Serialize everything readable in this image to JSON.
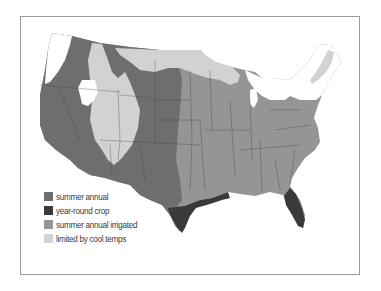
{
  "map": {
    "region": "Contiguous United States",
    "colors": {
      "summer_annual": "#6e6e6e",
      "year_round_crop": "#3a3a3a",
      "summer_annual_irrigated": "#959595",
      "limited_by_cool_temps": "#d2d2d2",
      "border": "#3f3f3f",
      "background": "#ffffff"
    }
  },
  "legend": {
    "items": [
      {
        "key": "summer_annual",
        "label": "summer annual",
        "color": "#6e6e6e"
      },
      {
        "key": "year_round_crop",
        "label": "year-round crop",
        "color": "#3a3a3a"
      },
      {
        "key": "summer_annual_irrigated",
        "label": "summer annual irrigated",
        "color": "#959595"
      },
      {
        "key": "limited_by_cool_temps",
        "label": "limited by cool temps",
        "color": "#d2d2d2"
      }
    ]
  }
}
